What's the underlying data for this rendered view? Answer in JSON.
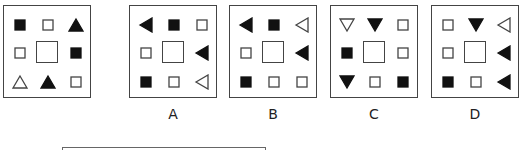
{
  "puzzle": {
    "question": {
      "grid": [
        [
          "square-filled",
          "square-outline",
          "triangle-up-filled"
        ],
        [
          "square-outline",
          "center",
          "square-filled"
        ],
        [
          "triangle-up-outline",
          "triangle-up-filled",
          "square-outline"
        ]
      ]
    },
    "options": [
      {
        "label": "A",
        "grid": [
          [
            "triangle-left-filled",
            "square-filled",
            "square-outline"
          ],
          [
            "square-outline",
            "center",
            "triangle-left-filled"
          ],
          [
            "square-filled",
            "square-outline",
            "triangle-left-outline"
          ]
        ]
      },
      {
        "label": "B",
        "grid": [
          [
            "triangle-left-filled",
            "square-filled",
            "triangle-left-outline"
          ],
          [
            "square-outline",
            "center",
            "triangle-left-filled"
          ],
          [
            "square-filled",
            "square-outline",
            "square-outline"
          ]
        ]
      },
      {
        "label": "C",
        "grid": [
          [
            "triangle-down-outline",
            "triangle-down-filled",
            "square-outline"
          ],
          [
            "square-filled",
            "center",
            "square-outline"
          ],
          [
            "triangle-down-filled",
            "square-outline",
            "square-filled"
          ]
        ]
      },
      {
        "label": "D",
        "grid": [
          [
            "square-outline",
            "triangle-down-filled",
            "triangle-left-outline"
          ],
          [
            "square-outline",
            "center",
            "triangle-left-filled"
          ],
          [
            "square-filled",
            "square-outline",
            "triangle-left-filled"
          ]
        ]
      }
    ]
  },
  "colors": {
    "stroke": "#444444",
    "fill": "#111111",
    "background": "#ffffff"
  }
}
